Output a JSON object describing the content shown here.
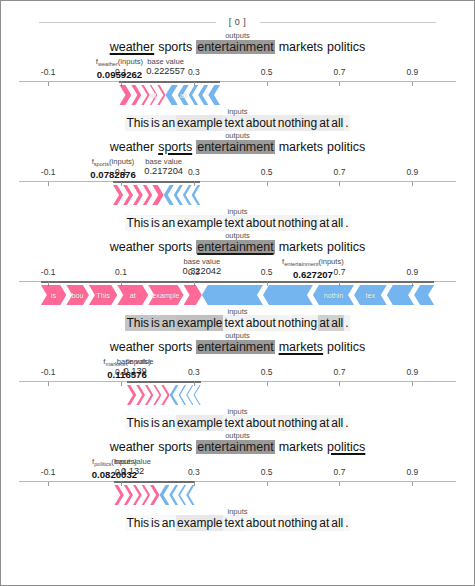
{
  "document": {
    "header_label": "[ 0 ]",
    "border_color": "#8e8e8e"
  },
  "labels": {
    "outputs": "outputs",
    "inputs": "inputs",
    "base_value_caption": "base value",
    "input_sentence": "This is an example text about nothing at all."
  },
  "output_classes": [
    "weather",
    "sports",
    "entertainment",
    "markets",
    "politics"
  ],
  "input_tokens": [
    "This",
    "is",
    "an",
    "example",
    "text",
    "about",
    "nothing",
    "at",
    "all",
    "."
  ],
  "axis": {
    "ticks": [
      -0.1,
      0.1,
      0.3,
      0.5,
      0.7,
      0.9
    ],
    "tick_labels": [
      "-0.1",
      "0.1",
      "0.3",
      "0.5",
      "0.7",
      "0.9"
    ],
    "min": -0.18,
    "max": 1.02
  },
  "colors": {
    "positive": "#ff0d57",
    "negative": "#1e88e5",
    "axis": "#b8b8b8",
    "axis_highlight": "#6d6d6d",
    "selected_token_bg": "#9a9a9a"
  },
  "chart_data": {
    "type": "bar",
    "title": "[ 0 ]",
    "xlabel": "",
    "ylabel": "",
    "axis_ticks": [
      -0.1,
      0.1,
      0.3,
      0.5,
      0.7,
      0.9
    ],
    "panels": [
      {
        "class": "weather",
        "fx_label": "f",
        "fx_sub": "weather",
        "fx_suffix": "(inputs)",
        "fx_value": "0.0959262",
        "fx_value_num": 0.0959262,
        "base_label": "base value",
        "base_value": "0.222557",
        "base_value_num": 0.222557,
        "selected_output": "weather",
        "highlighted_output": "entertainment",
        "segments": [
          {
            "label": "",
            "sign": "pos",
            "start": 0.0959262,
            "end": 0.1285
          },
          {
            "label": "",
            "sign": "pos",
            "start": 0.1285,
            "end": 0.156
          },
          {
            "label": "",
            "sign": "pos",
            "start": 0.156,
            "end": 0.179
          },
          {
            "label": "at",
            "sign": "pos",
            "start": 0.179,
            "end": 0.2
          },
          {
            "label": "",
            "sign": "pos",
            "start": 0.2,
            "end": 0.2226
          },
          {
            "label": "",
            "sign": "neg",
            "start": 0.2226,
            "end": 0.256
          },
          {
            "label": "all",
            "sign": "neg",
            "start": 0.256,
            "end": 0.286
          },
          {
            "label": "",
            "sign": "neg",
            "start": 0.286,
            "end": 0.312
          },
          {
            "label": "",
            "sign": "neg",
            "start": 0.312,
            "end": 0.34
          },
          {
            "label": "",
            "sign": "neg",
            "start": 0.34,
            "end": 0.372
          }
        ],
        "input_highlights": {
          "This": 0.1,
          "is": 0.1,
          "an": 0.12,
          "example": 0.22,
          "text": 0.16,
          "about": 0.18,
          "nothing": 0.2,
          "at": 0.2,
          "all": 0.18,
          ".": 0.1
        }
      },
      {
        "class": "sports",
        "fx_label": "f",
        "fx_sub": "sports",
        "fx_suffix": "(inputs)",
        "fx_value": "0.0782876",
        "fx_value_num": 0.0782876,
        "base_label": "base value",
        "base_value": "0.217204",
        "base_value_num": 0.217204,
        "selected_output": "sports",
        "highlighted_output": "entertainment",
        "segments": [
          {
            "label": "",
            "sign": "pos",
            "start": 0.0782876,
            "end": 0.106
          },
          {
            "label": "",
            "sign": "pos",
            "start": 0.106,
            "end": 0.133
          },
          {
            "label": "",
            "sign": "pos",
            "start": 0.133,
            "end": 0.16
          },
          {
            "label": "",
            "sign": "pos",
            "start": 0.16,
            "end": 0.186
          },
          {
            "label": "",
            "sign": "pos",
            "start": 0.186,
            "end": 0.2172
          },
          {
            "label": "",
            "sign": "neg",
            "start": 0.2172,
            "end": 0.245
          },
          {
            "label": "",
            "sign": "neg",
            "start": 0.245,
            "end": 0.27
          },
          {
            "label": "",
            "sign": "neg",
            "start": 0.27,
            "end": 0.294
          },
          {
            "label": "",
            "sign": "neg",
            "start": 0.294,
            "end": 0.318
          }
        ],
        "input_highlights": {
          "This": 0.08,
          "is": 0.08,
          "an": 0.08,
          "example": 0.1,
          "text": 0.1,
          "about": 0.1,
          "nothing": 0.12,
          "at": 0.1,
          "all": 0.1,
          ".": 0.06
        }
      },
      {
        "class": "entertainment",
        "fx_label": "f",
        "fx_sub": "entertainment",
        "fx_suffix": "(inputs)",
        "fx_value": "0.627207",
        "fx_value_num": 0.627207,
        "base_label": "base value",
        "base_value": "0.322042",
        "base_value_num": 0.322042,
        "selected_output": "entertainment",
        "highlighted_output": "entertainment",
        "segments": [
          {
            "label": "is",
            "sign": "pos",
            "start": -0.12,
            "end": -0.05
          },
          {
            "label": "bou",
            "sign": "pos",
            "start": -0.05,
            "end": 0.012
          },
          {
            "label": "This",
            "sign": "pos",
            "start": 0.012,
            "end": 0.09
          },
          {
            "label": "at",
            "sign": "pos",
            "start": 0.09,
            "end": 0.175
          },
          {
            "label": "example",
            "sign": "pos",
            "start": 0.175,
            "end": 0.272
          },
          {
            "label": "",
            "sign": "pos",
            "start": 0.272,
            "end": 0.322
          },
          {
            "label": "",
            "sign": "neg",
            "start": 0.322,
            "end": 0.49
          },
          {
            "label": "",
            "sign": "neg",
            "start": 0.49,
            "end": 0.627
          },
          {
            "label": "nothin",
            "sign": "neg",
            "start": 0.627,
            "end": 0.74
          },
          {
            "label": "tex",
            "sign": "neg",
            "start": 0.74,
            "end": 0.83
          },
          {
            "label": "",
            "sign": "neg",
            "start": 0.83,
            "end": 0.905
          },
          {
            "label": "",
            "sign": "neg",
            "start": 0.905,
            "end": 0.96
          }
        ],
        "input_highlights": {
          "This": 0.55,
          "is": 0.55,
          "an": 0.55,
          "example": 0.6,
          "text": 0.12,
          "about": 0.14,
          "nothing": 0.12,
          "at": 0.45,
          "all": 0.45,
          ".": 0.12
        }
      },
      {
        "class": "markets",
        "fx_label": "f",
        "fx_sub": "markets",
        "fx_suffix": "(inputs)",
        "fx_value": "0.116576",
        "fx_value_num": 0.116576,
        "base_label": "base value",
        "base_value": "0.139",
        "base_value_num": 0.139,
        "selected_output": "markets",
        "highlighted_output": "entertainment",
        "segments": [
          {
            "label": "",
            "sign": "pos",
            "start": 0.1166,
            "end": 0.142
          },
          {
            "label": "",
            "sign": "pos",
            "start": 0.142,
            "end": 0.166
          },
          {
            "label": "",
            "sign": "pos",
            "start": 0.166,
            "end": 0.189
          },
          {
            "label": "",
            "sign": "pos",
            "start": 0.189,
            "end": 0.211
          },
          {
            "label": "",
            "sign": "pos",
            "start": 0.211,
            "end": 0.234
          },
          {
            "label": "",
            "sign": "neg",
            "start": 0.234,
            "end": 0.258
          },
          {
            "label": "",
            "sign": "neg",
            "start": 0.258,
            "end": 0.279
          },
          {
            "label": "",
            "sign": "neg",
            "start": 0.279,
            "end": 0.299
          },
          {
            "label": "",
            "sign": "neg",
            "start": 0.299,
            "end": 0.319
          }
        ],
        "input_highlights": {
          "This": 0.06,
          "is": 0.06,
          "an": 0.06,
          "example": 0.2,
          "text": 0.1,
          "about": 0.1,
          "nothing": 0.14,
          "at": 0.12,
          "all": 0.12,
          ".": 0.06
        }
      },
      {
        "class": "politics",
        "fx_label": "f",
        "fx_sub": "politics",
        "fx_suffix": "(inputs)",
        "fx_value": "0.0820032",
        "fx_value_num": 0.0820032,
        "base_label": "base value",
        "base_value": "0.132",
        "base_value_num": 0.132,
        "selected_output": "politics",
        "highlighted_output": "entertainment",
        "segments": [
          {
            "label": "",
            "sign": "pos",
            "start": 0.082,
            "end": 0.108
          },
          {
            "label": "",
            "sign": "pos",
            "start": 0.108,
            "end": 0.133
          },
          {
            "label": "",
            "sign": "pos",
            "start": 0.133,
            "end": 0.157
          },
          {
            "label": "",
            "sign": "pos",
            "start": 0.157,
            "end": 0.18
          },
          {
            "label": "",
            "sign": "pos",
            "start": 0.18,
            "end": 0.206
          },
          {
            "label": "",
            "sign": "neg",
            "start": 0.206,
            "end": 0.233
          },
          {
            "label": "",
            "sign": "neg",
            "start": 0.233,
            "end": 0.257
          },
          {
            "label": "",
            "sign": "neg",
            "start": 0.257,
            "end": 0.279
          },
          {
            "label": "",
            "sign": "neg",
            "start": 0.279,
            "end": 0.302
          }
        ],
        "input_highlights": {
          "This": 0.06,
          "is": 0.06,
          "an": 0.06,
          "example": 0.22,
          "text": 0.1,
          "about": 0.08,
          "nothing": 0.1,
          "at": 0.1,
          "all": 0.1,
          ".": 0.06
        }
      }
    ]
  }
}
